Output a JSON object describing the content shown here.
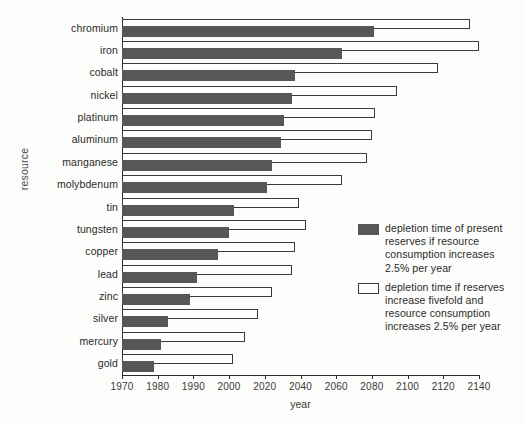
{
  "chart_data": {
    "type": "bar",
    "title": "",
    "subtitle": "",
    "xlabel": "year",
    "ylabel": "resource",
    "orientation": "horizontal",
    "grid": false,
    "legend_position": "inside-right",
    "xlim": [
      1970,
      2140
    ],
    "x_tick_labels": [
      "1970",
      "1980",
      "1990",
      "2000",
      "2020",
      "2040",
      "2060",
      "2080",
      "2100",
      "2120",
      "2140"
    ],
    "x_tick_values": [
      1970,
      1980,
      1990,
      2000,
      2020,
      2040,
      2060,
      2080,
      2100,
      2120,
      2140
    ],
    "categories": [
      "chromium",
      "iron",
      "cobalt",
      "nickel",
      "platinum",
      "aluminum",
      "manganese",
      "molybdenum",
      "tin",
      "tungsten",
      "copper",
      "lead",
      "zinc",
      "silver",
      "mercury",
      "gold"
    ],
    "series": [
      {
        "name": "depletion time of present reserves if resource consumption increases 2.5% per year",
        "style": "filled",
        "color": "#575757",
        "values": [
          2081,
          2063,
          2037,
          2035,
          2031,
          2029,
          2024,
          2021,
          2003,
          2000,
          1997,
          1991,
          1989,
          1983,
          1981,
          1979
        ]
      },
      {
        "name": "depletion time if reserves increase fivefold and resource consumption increases 2.5% per year",
        "style": "hollow",
        "color": "#ffffff",
        "values": [
          2135,
          2141,
          2117,
          2094,
          2082,
          2080,
          2077,
          2063,
          2039,
          2043,
          2037,
          2035,
          2024,
          2016,
          2009,
          2002
        ]
      }
    ]
  },
  "axis": {
    "y_title": "resource",
    "x_title": "year"
  },
  "legend": {
    "entries": [
      {
        "swatch": "filled-square",
        "text": "depletion time of present reserves if resource consumption increases 2.5% per year"
      },
      {
        "swatch": "hollow-square",
        "text": "depletion time if reserves increase fivefold and resource consumption increases 2.5% per year"
      }
    ]
  },
  "colors": {
    "present_reserves": "#575757",
    "fivefold_reserves": "#ffffff",
    "axis": "#2b2b2b",
    "background": "#fdfdfb"
  }
}
